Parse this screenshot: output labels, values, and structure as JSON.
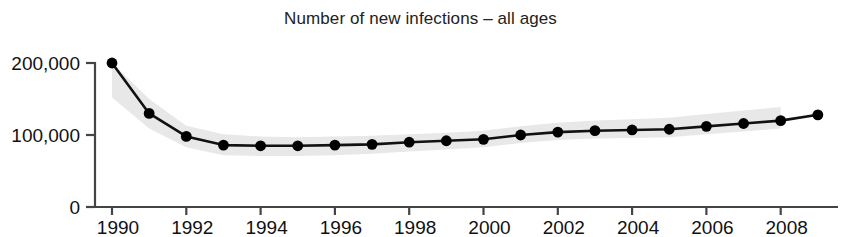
{
  "chart_data": {
    "type": "line",
    "title": "Number of new infections – all ages",
    "xlabel": "",
    "ylabel": "",
    "x": [
      1990,
      1991,
      1992,
      1993,
      1994,
      1995,
      1996,
      1997,
      1998,
      1999,
      2000,
      2001,
      2002,
      2003,
      2004,
      2005,
      2006,
      2007,
      2008,
      2009
    ],
    "values": [
      200000,
      130000,
      98000,
      86000,
      85000,
      85000,
      86000,
      87000,
      90000,
      92000,
      94000,
      100000,
      104000,
      106000,
      107000,
      108000,
      112000,
      116000,
      120000,
      128000
    ],
    "band_upper": [
      200000,
      150000,
      113000,
      101000,
      98000,
      97000,
      98000,
      99000,
      101000,
      103000,
      106000,
      112000,
      117000,
      120000,
      122000,
      124000,
      129000,
      134000,
      139000
    ],
    "band_lower": [
      152000,
      109000,
      83000,
      72000,
      71000,
      71000,
      72000,
      74000,
      77000,
      80000,
      83000,
      89000,
      93000,
      95000,
      96000,
      97000,
      101000,
      105000,
      109000
    ],
    "band_x": [
      1990,
      1991,
      1992,
      1993,
      1994,
      1995,
      1996,
      1997,
      1998,
      1999,
      2000,
      2001,
      2002,
      2003,
      2004,
      2005,
      2006,
      2007,
      2008
    ],
    "xlim": [
      1989.5,
      2009.5
    ],
    "ylim": [
      0,
      210000
    ],
    "y_ticks": [
      0,
      100000,
      200000
    ],
    "y_tick_labels": [
      "0",
      "100,000",
      "200,000"
    ],
    "x_ticks": [
      1990,
      1992,
      1994,
      1996,
      1998,
      2000,
      2002,
      2004,
      2006,
      2008
    ],
    "x_tick_labels": [
      "1990",
      "1992",
      "1994",
      "1996",
      "1998",
      "2000",
      "2002",
      "2004",
      "2006",
      "2008"
    ],
    "grid": false,
    "legend": null,
    "series_name": "New infections",
    "band_name": "Uncertainty range",
    "colors": {
      "line": "#111111",
      "marker": "#000000",
      "band": "#e8e8e8",
      "axis": "#444444",
      "text": "#111111"
    }
  }
}
